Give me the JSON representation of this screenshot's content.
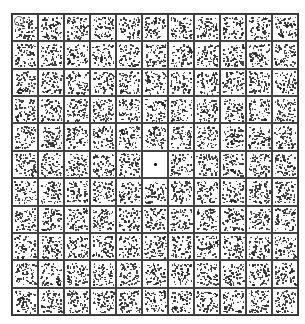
{
  "figure": {
    "type": "stippled-grid-stimulus",
    "rows": 11,
    "cols": 11,
    "blank_cell": {
      "row": 5,
      "col": 5,
      "has_center_dot": true
    },
    "corner_mark_cell": {
      "row": 0,
      "col": 0
    },
    "dots_per_cell": 70,
    "colors": {
      "line": "#444444",
      "dot": "#222222",
      "background": "#ffffff"
    }
  }
}
